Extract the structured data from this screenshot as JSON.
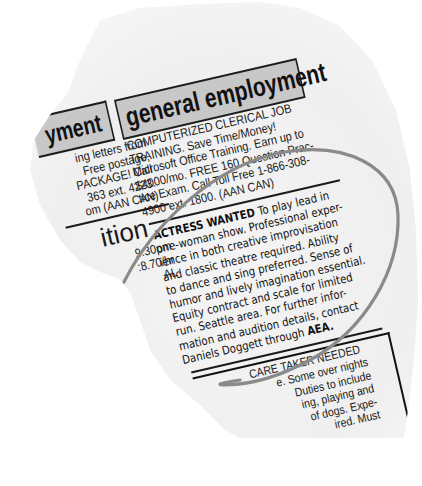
{
  "left_column": {
    "header_fragment": "yment",
    "lines": [
      "ing letters from",
      "Free  postage,",
      "PACKAGE! Call",
      "363  ext.  4223.",
      "om (AAN CAN)"
    ],
    "big_fragment": "ition",
    "small_lines": [
      "9:30pm",
      ":8.70/hr",
      "AL"
    ]
  },
  "main_column": {
    "header": "general employment",
    "clerical_ad": [
      "COMPUTERIZED    CLERICAL    JOB",
      "TRAINING.       Save    Time/Money!",
      "Microsoft Office Training. Earn up to",
      "$4000/mo. FREE 160 Question Prac-",
      "tice Exam. Call Toll Free 1-866-308-",
      "4900 ext. 1800. (AAN CAN)"
    ],
    "actress_ad": {
      "title": "ACTRESS WANTED",
      "first_line_rest": "  To play lead in",
      "lines": [
        "one-woman show. Professional exper-",
        "ience in both creative improvisation",
        "and classic theatre required. Ability",
        "to dance and sing preferred. Sense of",
        "humor and lively imagination essential.",
        "Equity contract  and  scale for limited",
        "run.  Seattle area.  For further infor-",
        "mation and audition details, contact"
      ],
      "last_line_pre": "Daniels Doggett through ",
      "last_line_bold": "AEA."
    },
    "caretaker_ad": {
      "title": "CARE TAKER NEEDED",
      "lines": [
        "e. Some over nights",
        "Duties  to  include",
        "ing,  playing  and",
        "of dogs. Expe-",
        "ired.  Must"
      ]
    }
  },
  "annotation": {
    "type": "hand-drawn circle",
    "color": "#8a8a8a"
  }
}
